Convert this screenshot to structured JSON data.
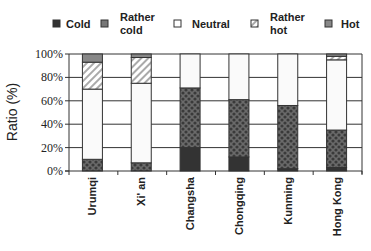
{
  "chart_data": {
    "type": "bar",
    "stacked": true,
    "title": "",
    "xlabel": "",
    "ylabel": "Ratio (%)",
    "ylim": [
      0,
      100
    ],
    "yticks": [
      0,
      20,
      40,
      60,
      80,
      100
    ],
    "ytick_labels": [
      "0%",
      "20%",
      "40%",
      "60%",
      "80%",
      "100%"
    ],
    "grid": true,
    "legend_position": "top",
    "categories": [
      "Urumqi",
      "Xi' an",
      "Changsha",
      "Chongqing",
      "Kunming",
      "Hong Kong"
    ],
    "series": [
      {
        "name": "Cold",
        "legend_lines": [
          "Cold"
        ],
        "pattern": "solid-dark",
        "color": "#333333",
        "values": [
          0,
          0,
          20,
          12,
          2,
          3
        ]
      },
      {
        "name": "Rather cold",
        "legend_lines": [
          "Rather",
          "cold"
        ],
        "pattern": "crosshatch",
        "color": "#555555",
        "values": [
          10,
          7,
          51,
          49,
          54,
          32
        ]
      },
      {
        "name": "Neutral",
        "legend_lines": [
          "Neutral"
        ],
        "pattern": "white",
        "color": "#fafafa",
        "values": [
          60,
          68,
          29,
          39,
          44,
          60
        ]
      },
      {
        "name": "Rather hot",
        "legend_lines": [
          "Rather",
          "hot"
        ],
        "pattern": "diagonal",
        "color": "#bbbbbb",
        "values": [
          23,
          22,
          0,
          0,
          0,
          3
        ]
      },
      {
        "name": "Hot",
        "legend_lines": [
          "Hot"
        ],
        "pattern": "solid-gray",
        "color": "#888888",
        "values": [
          7,
          3,
          0,
          0,
          0,
          2
        ]
      }
    ]
  }
}
